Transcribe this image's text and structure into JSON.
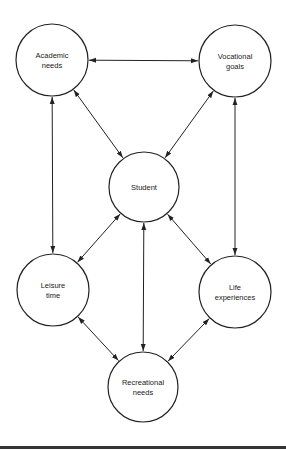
{
  "diagram": {
    "nodes": [
      {
        "id": "academic",
        "lines": [
          "Academic",
          "needs"
        ],
        "cx": 52,
        "cy": 60,
        "r": 36
      },
      {
        "id": "vocational",
        "lines": [
          "Vocational",
          "goals"
        ],
        "cx": 235,
        "cy": 61,
        "r": 36
      },
      {
        "id": "student",
        "lines": [
          "Student"
        ],
        "cx": 144,
        "cy": 187,
        "r": 35
      },
      {
        "id": "leisure",
        "lines": [
          "Leisure",
          "time"
        ],
        "cx": 53,
        "cy": 290,
        "r": 36
      },
      {
        "id": "life",
        "lines": [
          "Life",
          "experiences"
        ],
        "cx": 235,
        "cy": 292,
        "r": 36
      },
      {
        "id": "recreational",
        "lines": [
          "Recreational",
          "needs"
        ],
        "cx": 143,
        "cy": 387,
        "r": 35
      }
    ],
    "edges": [
      {
        "from": "academic",
        "to": "vocational",
        "bidirectional": true
      },
      {
        "from": "academic",
        "to": "student",
        "bidirectional": true
      },
      {
        "from": "vocational",
        "to": "student",
        "bidirectional": true
      },
      {
        "from": "academic",
        "to": "leisure",
        "bidirectional": true
      },
      {
        "from": "vocational",
        "to": "life",
        "bidirectional": true
      },
      {
        "from": "student",
        "to": "leisure",
        "bidirectional": true
      },
      {
        "from": "student",
        "to": "life",
        "bidirectional": true
      },
      {
        "from": "student",
        "to": "recreational",
        "bidirectional": true
      },
      {
        "from": "leisure",
        "to": "recreational",
        "bidirectional": true
      },
      {
        "from": "life",
        "to": "recreational",
        "bidirectional": true
      }
    ],
    "colors": {
      "stroke": "#222222",
      "background": "#ffffff",
      "rule": "#333333"
    }
  }
}
